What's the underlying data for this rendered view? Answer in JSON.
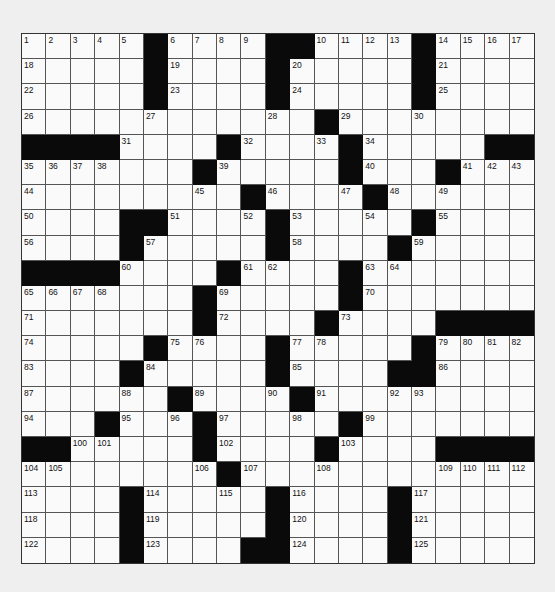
{
  "puzzle": {
    "rows": 21,
    "cols": 21,
    "colors": {
      "block": "#0a0a0a",
      "cell": "#fafafa",
      "background": "#efefef",
      "gridline": "#555555"
    },
    "pattern": [
      ".....#....##....#....",
      ".....#....#.....#....",
      ".....#....#.....#....",
      "............#........",
      "####....#....#.....##",
      ".......#.....#...#...",
      ".........#....#......",
      "....##....#.....#....",
      "....#.....#....#.....",
      "####....#....#.......",
      ".......#.....#.......",
      ".......#....#....####",
      ".....#....#.....#....",
      "....#.....#....##....",
      "......#....#.........",
      "...#...#.....#.......",
      "##.....#....#....####",
      "........#............",
      "....#.....#....#.....",
      "....#.....#....#.....",
      "....#....##....#....."
    ],
    "numbers": [
      [
        0,
        0,
        1
      ],
      [
        0,
        1,
        2
      ],
      [
        0,
        2,
        3
      ],
      [
        0,
        3,
        4
      ],
      [
        0,
        4,
        5
      ],
      [
        0,
        6,
        6
      ],
      [
        0,
        7,
        7
      ],
      [
        0,
        8,
        8
      ],
      [
        0,
        9,
        9
      ],
      [
        0,
        12,
        10
      ],
      [
        0,
        13,
        11
      ],
      [
        0,
        14,
        12
      ],
      [
        0,
        15,
        13
      ],
      [
        0,
        17,
        14
      ],
      [
        0,
        18,
        15
      ],
      [
        0,
        19,
        16
      ],
      [
        0,
        20,
        17
      ],
      [
        1,
        0,
        18
      ],
      [
        1,
        6,
        19
      ],
      [
        1,
        11,
        20
      ],
      [
        1,
        17,
        21
      ],
      [
        2,
        0,
        22
      ],
      [
        2,
        6,
        23
      ],
      [
        2,
        11,
        24
      ],
      [
        2,
        17,
        25
      ],
      [
        3,
        0,
        26
      ],
      [
        3,
        5,
        27
      ],
      [
        3,
        10,
        28
      ],
      [
        3,
        13,
        29
      ],
      [
        3,
        16,
        30
      ],
      [
        4,
        4,
        31
      ],
      [
        4,
        9,
        32
      ],
      [
        4,
        12,
        33
      ],
      [
        4,
        14,
        34
      ],
      [
        5,
        0,
        35
      ],
      [
        5,
        1,
        36
      ],
      [
        5,
        2,
        37
      ],
      [
        5,
        3,
        38
      ],
      [
        5,
        8,
        39
      ],
      [
        5,
        14,
        40
      ],
      [
        5,
        18,
        41
      ],
      [
        5,
        19,
        42
      ],
      [
        5,
        20,
        43
      ],
      [
        6,
        0,
        44
      ],
      [
        6,
        7,
        45
      ],
      [
        6,
        10,
        46
      ],
      [
        6,
        13,
        47
      ],
      [
        6,
        15,
        48
      ],
      [
        6,
        17,
        49
      ],
      [
        7,
        0,
        50
      ],
      [
        7,
        6,
        51
      ],
      [
        7,
        9,
        52
      ],
      [
        7,
        11,
        53
      ],
      [
        7,
        14,
        54
      ],
      [
        7,
        17,
        55
      ],
      [
        8,
        0,
        56
      ],
      [
        8,
        5,
        57
      ],
      [
        8,
        11,
        58
      ],
      [
        8,
        16,
        59
      ],
      [
        9,
        4,
        60
      ],
      [
        9,
        9,
        61
      ],
      [
        9,
        10,
        62
      ],
      [
        9,
        14,
        63
      ],
      [
        9,
        15,
        64
      ],
      [
        10,
        0,
        65
      ],
      [
        10,
        1,
        66
      ],
      [
        10,
        2,
        67
      ],
      [
        10,
        3,
        68
      ],
      [
        10,
        8,
        69
      ],
      [
        10,
        14,
        70
      ],
      [
        11,
        0,
        71
      ],
      [
        11,
        8,
        72
      ],
      [
        11,
        13,
        73
      ],
      [
        12,
        0,
        74
      ],
      [
        12,
        6,
        75
      ],
      [
        12,
        7,
        76
      ],
      [
        12,
        11,
        77
      ],
      [
        12,
        12,
        78
      ],
      [
        12,
        17,
        79
      ],
      [
        12,
        18,
        80
      ],
      [
        12,
        19,
        81
      ],
      [
        12,
        20,
        82
      ],
      [
        13,
        0,
        83
      ],
      [
        13,
        5,
        84
      ],
      [
        13,
        11,
        85
      ],
      [
        13,
        17,
        86
      ],
      [
        14,
        0,
        87
      ],
      [
        14,
        4,
        88
      ],
      [
        14,
        7,
        89
      ],
      [
        14,
        10,
        90
      ],
      [
        14,
        12,
        91
      ],
      [
        14,
        15,
        92
      ],
      [
        14,
        16,
        93
      ],
      [
        15,
        0,
        94
      ],
      [
        15,
        4,
        95
      ],
      [
        15,
        6,
        96
      ],
      [
        15,
        8,
        97
      ],
      [
        15,
        11,
        98
      ],
      [
        15,
        14,
        99
      ],
      [
        16,
        2,
        100
      ],
      [
        16,
        3,
        101
      ],
      [
        16,
        8,
        102
      ],
      [
        16,
        13,
        103
      ],
      [
        17,
        0,
        104
      ],
      [
        17,
        1,
        105
      ],
      [
        17,
        7,
        106
      ],
      [
        17,
        9,
        107
      ],
      [
        17,
        12,
        108
      ],
      [
        17,
        17,
        109
      ],
      [
        17,
        18,
        110
      ],
      [
        17,
        19,
        111
      ],
      [
        17,
        20,
        112
      ],
      [
        18,
        0,
        113
      ],
      [
        18,
        5,
        114
      ],
      [
        18,
        8,
        115
      ],
      [
        18,
        11,
        116
      ],
      [
        18,
        16,
        117
      ],
      [
        19,
        0,
        118
      ],
      [
        19,
        5,
        119
      ],
      [
        19,
        11,
        120
      ],
      [
        19,
        16,
        121
      ],
      [
        20,
        0,
        122
      ],
      [
        20,
        5,
        123
      ],
      [
        20,
        11,
        124
      ],
      [
        20,
        16,
        125
      ]
    ]
  }
}
